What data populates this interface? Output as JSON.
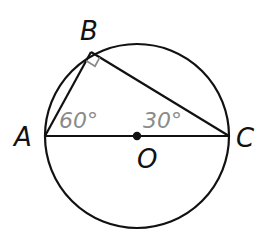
{
  "diagram": {
    "type": "inscribed-right-triangle-in-circle",
    "colors": {
      "stroke": "#111111",
      "angle_label": "#8a8a8a",
      "right_angle_marker": "#8a8a8a",
      "background": "#ffffff"
    },
    "circle": {
      "center_label": "O"
    },
    "points": {
      "A": {
        "label": "A"
      },
      "B": {
        "label": "B"
      },
      "C": {
        "label": "C"
      },
      "O": {
        "label": "O"
      }
    },
    "angles": {
      "A": {
        "label": "60°"
      },
      "C": {
        "label": "30°"
      },
      "B": {
        "marker": "right-angle"
      }
    },
    "segments": [
      "AB",
      "BC",
      "AC"
    ]
  }
}
